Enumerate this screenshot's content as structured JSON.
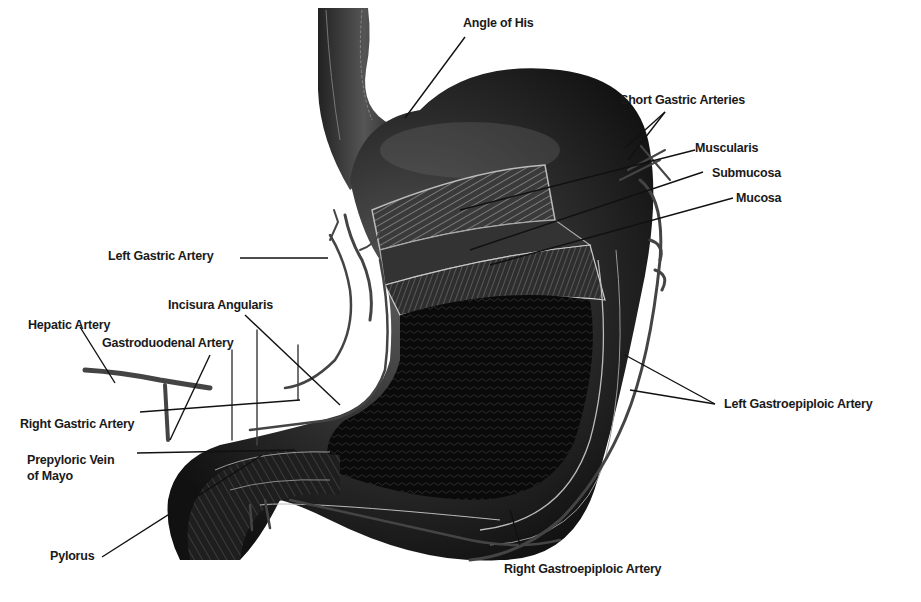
{
  "figure": {
    "labels": {
      "angle_of_his": "Angle of His",
      "short_gastric": "Short Gastric Arteries",
      "muscularis": "Muscularis",
      "submucosa": "Submucosa",
      "mucosa": "Mucosa",
      "left_gastric": "Left Gastric Artery",
      "incisura": "Incisura Angularis",
      "hepatic": "Hepatic Artery",
      "gastroduodenal": "Gastroduodenal Artery",
      "right_gastric": "Right Gastric Artery",
      "prepyloric_1": "Prepyloric Vein",
      "prepyloric_2": "of Mayo",
      "pylorus": "Pylorus",
      "left_gastroepiploic": "Left Gastroepiploic Artery",
      "right_gastroepiploic": "Right Gastroepiploic Artery"
    }
  },
  "colors": {
    "tissue_dark": "#1c1c1c",
    "tissue_mid": "#3a3a3a",
    "vessel": "#4a4a4a",
    "leader": "#111111",
    "background": "#ffffff"
  }
}
